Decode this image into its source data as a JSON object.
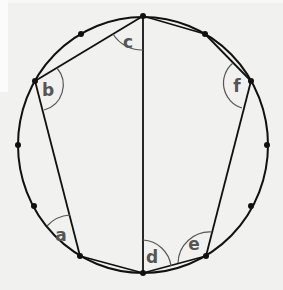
{
  "diagram": {
    "colors": {
      "background": "#f1f1f0",
      "stroke": "#111111",
      "arc": "#555555",
      "label": "#555555"
    },
    "circle": {
      "cx": 143,
      "cy": 145,
      "r": 126
    },
    "vertices": {
      "top": [
        143,
        16
      ],
      "b": [
        35,
        81
      ],
      "a": [
        80,
        256
      ],
      "bottom": [
        143,
        273
      ],
      "e": [
        206,
        256
      ],
      "f": [
        251,
        81
      ]
    },
    "extra_points": [
      [
        81,
        34
      ],
      [
        205,
        34
      ],
      [
        18,
        145
      ],
      [
        267,
        145
      ],
      [
        34,
        206
      ],
      [
        251,
        206
      ]
    ],
    "angle_labels": {
      "a": "a",
      "b": "b",
      "c": "c",
      "d": "d",
      "e": "e",
      "f": "f"
    }
  }
}
